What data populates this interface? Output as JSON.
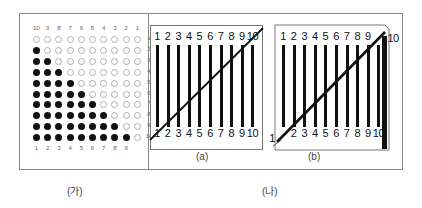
{
  "panel_ga": {
    "caption": "(가)",
    "top_labels": [
      "10",
      "9",
      "8",
      "7",
      "6",
      "5",
      "4",
      "3",
      "2",
      "1"
    ],
    "right_labels": [
      "1",
      "2",
      "3",
      "4",
      "5",
      "6",
      "7",
      "8",
      "9",
      "10"
    ],
    "bottom_labels": [
      "1",
      "2",
      "3",
      "4",
      "5",
      "6",
      "7",
      "8",
      "9"
    ],
    "filled_per_row": [
      0,
      1,
      2,
      3,
      4,
      5,
      6,
      7,
      8,
      9
    ],
    "columns": 10,
    "rows": 10
  },
  "panel_na": {
    "caption": "(나)",
    "sub_a": {
      "caption": "(a)",
      "top_labels": [
        "1",
        "2",
        "3",
        "4",
        "5",
        "6",
        "7",
        "8",
        "9",
        "10"
      ],
      "bottom_labels": [
        "1",
        "2",
        "3",
        "4",
        "5",
        "6",
        "7",
        "8",
        "9",
        "10"
      ]
    },
    "sub_b": {
      "caption": "(b)",
      "top_labels": [
        "1",
        "2",
        "3",
        "4",
        "5",
        "6",
        "7",
        "8",
        "9"
      ],
      "top_right_label": "10",
      "bottom_left_label": "1",
      "bottom_labels": [
        "2",
        "3",
        "4",
        "5",
        "6",
        "7",
        "8",
        "9",
        "10"
      ]
    }
  },
  "colors": {
    "frame": "#8a8a8a",
    "ink": "#111111",
    "empty_dot": "#b0b0b0"
  }
}
